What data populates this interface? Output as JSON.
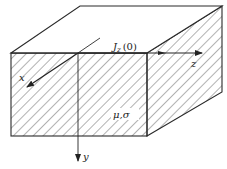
{
  "diagram": {
    "type": "3d-conducting-block",
    "labels": {
      "current": "J",
      "current_sub": "z",
      "current_arg": "(0)",
      "x_axis": "x",
      "y_axis": "y",
      "z_axis": "z",
      "material": "μ,σ"
    },
    "colors": {
      "line": "#2a2a2a",
      "hatch": "#555555",
      "background": "#ffffff"
    }
  }
}
